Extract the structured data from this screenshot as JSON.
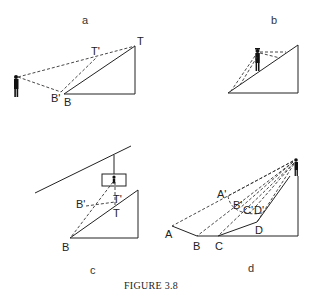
{
  "figure": {
    "caption": "FIGURE 3.8",
    "panels": {
      "a": {
        "label": "a",
        "points": {
          "T_prime": "T'",
          "T": "T",
          "B_prime": "B'",
          "B": "B"
        }
      },
      "b": {
        "label": "b"
      },
      "c": {
        "label": "c",
        "points": {
          "B_prime": "B'",
          "T_prime": "T'",
          "T": "T",
          "B": "B"
        }
      },
      "d": {
        "label": "d",
        "points": {
          "A_prime": "A'",
          "B_prime": "B'",
          "C_prime": "C'",
          "D_prime": "D'",
          "A": "A",
          "B": "B",
          "C": "C",
          "D": "D"
        }
      }
    },
    "colors": {
      "ink": "#222222",
      "background": "#ffffff"
    }
  }
}
